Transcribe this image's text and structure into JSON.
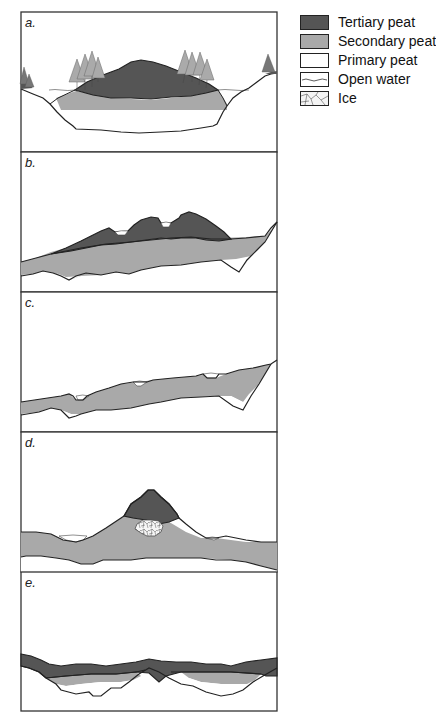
{
  "figure": {
    "panels": [
      {
        "id": "a",
        "label": "a."
      },
      {
        "id": "b",
        "label": "b."
      },
      {
        "id": "c",
        "label": "c."
      },
      {
        "id": "d",
        "label": "d."
      },
      {
        "id": "e",
        "label": "e."
      }
    ]
  },
  "legend": {
    "items": [
      {
        "key": "tertiary",
        "label": "Tertiary peat",
        "color": "#555555",
        "icon": "dark-fill-swatch"
      },
      {
        "key": "secondary",
        "label": "Secondary peat",
        "color": "#a9a9a9",
        "icon": "grey-fill-swatch"
      },
      {
        "key": "primary",
        "label": "Primary peat",
        "color": "#ffffff",
        "icon": "white-fill-swatch"
      },
      {
        "key": "water",
        "label": "Open water",
        "color": "#ffffff",
        "icon": "wavy-line-swatch"
      },
      {
        "key": "ice",
        "label": "Ice",
        "color": "#f4f4f4",
        "icon": "crackle-pattern-swatch"
      }
    ]
  },
  "colors": {
    "outline": "#222222",
    "tertiary": "#555555",
    "secondary": "#a9a9a9",
    "tree": "#777777"
  }
}
